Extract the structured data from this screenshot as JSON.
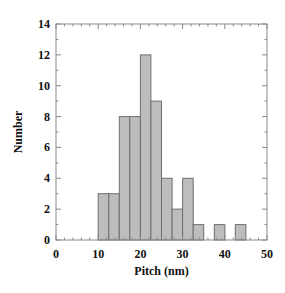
{
  "chart_data": {
    "type": "bar",
    "title": "",
    "xlabel": "Pitch (nm)",
    "ylabel": "Number",
    "xlim": [
      0,
      50
    ],
    "ylim": [
      0,
      14
    ],
    "xticks": [
      0,
      10,
      20,
      30,
      40,
      50
    ],
    "yticks": [
      0,
      2,
      4,
      6,
      8,
      10,
      12,
      14
    ],
    "grid": false,
    "legend": null,
    "bin_width": 2.5,
    "bins": [
      {
        "start": 10.0,
        "end": 12.5,
        "count": 3
      },
      {
        "start": 12.5,
        "end": 15.0,
        "count": 3
      },
      {
        "start": 15.0,
        "end": 17.5,
        "count": 8
      },
      {
        "start": 17.5,
        "end": 20.0,
        "count": 8
      },
      {
        "start": 20.0,
        "end": 22.5,
        "count": 12
      },
      {
        "start": 22.5,
        "end": 25.0,
        "count": 9
      },
      {
        "start": 25.0,
        "end": 27.5,
        "count": 4
      },
      {
        "start": 27.5,
        "end": 30.0,
        "count": 2
      },
      {
        "start": 30.0,
        "end": 32.5,
        "count": 4
      },
      {
        "start": 32.5,
        "end": 35.0,
        "count": 1
      },
      {
        "start": 35.0,
        "end": 37.5,
        "count": 0
      },
      {
        "start": 37.5,
        "end": 40.0,
        "count": 1
      },
      {
        "start": 40.0,
        "end": 42.5,
        "count": 0
      },
      {
        "start": 42.5,
        "end": 45.0,
        "count": 1
      }
    ],
    "categories": [
      "10-12.5",
      "12.5-15",
      "15-17.5",
      "17.5-20",
      "20-22.5",
      "22.5-25",
      "25-27.5",
      "27.5-30",
      "30-32.5",
      "32.5-35",
      "35-37.5",
      "37.5-40",
      "40-42.5",
      "42.5-45"
    ],
    "values": [
      3,
      3,
      8,
      8,
      12,
      9,
      4,
      2,
      4,
      1,
      0,
      1,
      0,
      1
    ],
    "colors": {
      "bar_fill": "#bdbdbd",
      "bar_stroke": "#6f6f6f",
      "axis": "#8a8a8a"
    }
  }
}
